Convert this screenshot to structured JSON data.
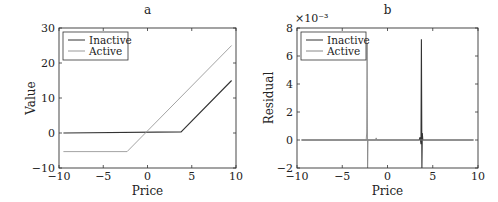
{
  "chart_data": [
    {
      "type": "line",
      "title": "a",
      "xlabel": "Price",
      "ylabel": "Value",
      "xlim": [
        -10,
        10
      ],
      "ylim": [
        -10,
        30
      ],
      "xticks": [
        -10,
        -5,
        0,
        5,
        10
      ],
      "yticks": [
        -10,
        0,
        10,
        20,
        30
      ],
      "xtick_labels": [
        "−10",
        "−5",
        "0",
        "5",
        "10"
      ],
      "ytick_labels": [
        "−10",
        "0",
        "10",
        "20",
        "30"
      ],
      "legend": {
        "position": "top-left",
        "entries": [
          "Inactive",
          "Active"
        ]
      },
      "grid": false,
      "series": [
        {
          "name": "Inactive",
          "color": "#333333",
          "x": [
            -9.5,
            3.8,
            9.5
          ],
          "y": [
            0,
            0.3,
            15
          ]
        },
        {
          "name": "Active",
          "color": "#999999",
          "x": [
            -9.5,
            -2.3,
            9.5
          ],
          "y": [
            -5.3,
            -5.3,
            25
          ]
        }
      ]
    },
    {
      "type": "line",
      "title": "b",
      "xlabel": "Price",
      "ylabel": "Residual",
      "scale_label": "×10⁻³",
      "xlim": [
        -10,
        10
      ],
      "ylim": [
        -2,
        8
      ],
      "xticks": [
        -10,
        -5,
        0,
        5,
        10
      ],
      "yticks": [
        -2,
        0,
        2,
        4,
        6,
        8
      ],
      "xtick_labels": [
        "−10",
        "−5",
        "0",
        "5",
        "10"
      ],
      "ytick_labels": [
        "−2",
        "0",
        "2",
        "4",
        "6",
        "8"
      ],
      "legend": {
        "position": "top-left",
        "entries": [
          "Inactive",
          "Active"
        ]
      },
      "grid": false,
      "series": [
        {
          "name": "Inactive",
          "color": "#333333",
          "x": [
            -9.5,
            3.5,
            3.6,
            3.7,
            3.75,
            3.8,
            3.85,
            3.9,
            9.5
          ],
          "y": [
            0,
            0,
            0.2,
            -0.3,
            7.2,
            -2.0,
            0.5,
            0,
            0
          ]
        },
        {
          "name": "Active",
          "color": "#888888",
          "x": [
            -9.5,
            -2.35,
            -2.3,
            -2.25,
            -2.2,
            -2.15,
            -1.3,
            -1.25,
            -1.2,
            9.5
          ],
          "y": [
            0,
            0,
            0.5,
            6.9,
            -2.0,
            0,
            0,
            0.15,
            0,
            0
          ]
        }
      ]
    }
  ]
}
